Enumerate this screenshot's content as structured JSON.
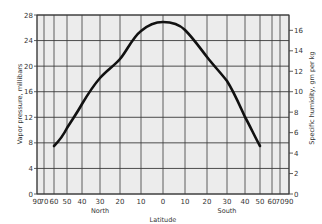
{
  "chart_data": {
    "type": "line",
    "title": "",
    "xlabel": "Latitude",
    "xlabel_north": "North",
    "xlabel_south": "South",
    "ylabel": "Vapor pressure, millibars",
    "ylabel_right": "Specific humidity, gm per kg",
    "ylim": [
      0,
      28
    ],
    "ylim_right": [
      0,
      17.5
    ],
    "grid": true,
    "legend": null,
    "x_scale": "sine of latitude",
    "x_ticks": [
      "90",
      "70",
      "60",
      "50",
      "40",
      "30",
      "20",
      "10",
      "0",
      "10",
      "20",
      "30",
      "40",
      "50",
      "60",
      "70",
      "90"
    ],
    "x_tick_values": [
      -90,
      -70,
      -60,
      -50,
      -40,
      -30,
      -20,
      -10,
      0,
      10,
      20,
      30,
      40,
      50,
      60,
      70,
      90
    ],
    "y_ticks": [
      0,
      4,
      8,
      12,
      16,
      20,
      24,
      28
    ],
    "y_ticks_right": [
      0,
      2,
      4,
      6,
      8,
      10,
      12,
      14,
      16
    ],
    "series": [
      {
        "name": "Vapor pressure by latitude",
        "x": [
          -60,
          -50,
          -40,
          -30,
          -20,
          -10,
          0,
          10,
          20,
          30,
          40,
          50
        ],
        "values": [
          7.5,
          10.5,
          14,
          18.5,
          21.5,
          25.5,
          27,
          26,
          21.5,
          18,
          12,
          7.5
        ]
      }
    ]
  },
  "plot": {
    "left": 37,
    "right": 289,
    "top": 15,
    "bottom": 194,
    "x_pixels": [
      37,
      44,
      54,
      67,
      82,
      100,
      120,
      141,
      163,
      185,
      207,
      227,
      245,
      260,
      272,
      280,
      289
    ],
    "curve_path": "M54,146 C58,142 63,136 67,128 C72,120 77,113 82,104 C88,94 93,86 100,78 C107,70 114,66 120,59 C127,51 132,38 141,31 C148,25 156,22 163,22 C171,22 179,24 185,30 C193,38 200,48 207,57 C214,66 220,72 227,81 C234,92 239,104 245,117 C250,126 255,137 260,146",
    "colors": {
      "background": "#ececec",
      "grid": "#3a3a3a",
      "curve": "#111111",
      "text": "#333333"
    }
  }
}
